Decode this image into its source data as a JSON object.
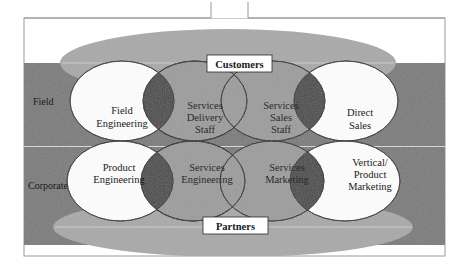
{
  "diagram": {
    "type": "venn-overlap",
    "colors": {
      "background": "#ffffff",
      "frame": "#9a9a9a",
      "band": "#7a7a7a",
      "band_divider": "#d8d8d8",
      "outer_ellipse": "#a9a9a9",
      "inner_ellipse_white": "#ffffff",
      "inner_ellipse_grey": "#9c9c9c",
      "overlap_dark": "#4a4a4a",
      "stroke": "#2a2a2a"
    },
    "rows": [
      {
        "label": "Field"
      },
      {
        "label": "Corporate"
      }
    ],
    "outer": {
      "top": {
        "label": "Customers"
      },
      "bottom": {
        "label": "Partners"
      }
    },
    "field_row": [
      {
        "line1": "Field",
        "line2": "Engineering",
        "line3": "",
        "fill": "white"
      },
      {
        "line1": "Services",
        "line2": "Delivery",
        "line3": "Staff",
        "fill": "grey"
      },
      {
        "line1": "Services",
        "line2": "Sales",
        "line3": "Staff",
        "fill": "grey"
      },
      {
        "line1": "Direct",
        "line2": "Sales",
        "line3": "",
        "fill": "white"
      }
    ],
    "corporate_row": [
      {
        "line1": "Product",
        "line2": "Engineering",
        "line3": "",
        "fill": "white"
      },
      {
        "line1": "Services",
        "line2": "Engineering",
        "line3": "",
        "fill": "grey"
      },
      {
        "line1": "Services",
        "line2": "Marketing",
        "line3": "",
        "fill": "grey"
      },
      {
        "line1": "Vertical/",
        "line2": "Product",
        "line3": "Marketing",
        "fill": "white"
      }
    ]
  }
}
